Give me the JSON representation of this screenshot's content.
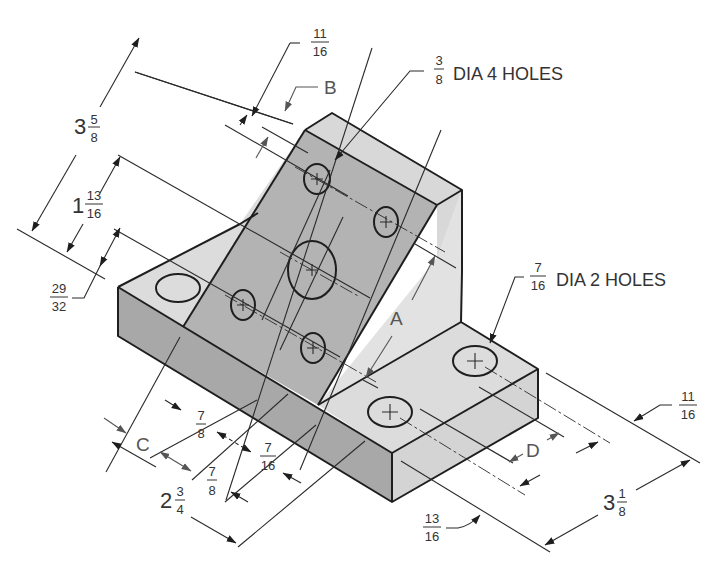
{
  "figure": {
    "type": "isometric dimensioned drawing"
  },
  "notes": {
    "holes_small": {
      "whole": "",
      "num": "3",
      "den": "8",
      "text": "DIA 4 HOLES"
    },
    "holes_base": {
      "whole": "",
      "num": "7",
      "den": "16",
      "text": "DIA 2 HOLES"
    }
  },
  "dimensions": {
    "overall_height_incline": {
      "whole": "3",
      "num": "5",
      "den": "8"
    },
    "top_offset": {
      "whole": "",
      "num": "11",
      "den": "16"
    },
    "hole_spacing_incline": {
      "whole": "1",
      "num": "13",
      "den": "16"
    },
    "lower_offset": {
      "whole": "",
      "num": "29",
      "den": "32"
    },
    "width_base_front": {
      "whole": "2",
      "num": "3",
      "den": "4"
    },
    "hole_spacing_a": {
      "whole": "",
      "num": "7",
      "den": "8"
    },
    "hole_spacing_b": {
      "whole": "",
      "num": "7",
      "den": "8"
    },
    "edge_offset_front": {
      "whole": "",
      "num": "7",
      "den": "16"
    },
    "base_depth": {
      "whole": "3",
      "num": "1",
      "den": "8"
    },
    "base_hole_offset_right": {
      "whole": "",
      "num": "11",
      "den": "16"
    },
    "base_hole_offset_front": {
      "whole": "",
      "num": "13",
      "den": "16"
    }
  },
  "unknowns": {
    "a": "A",
    "b": "B",
    "c": "C",
    "d": "D"
  },
  "colors": {
    "line": "#1e1e1e",
    "face_dark": "#a8a8a8",
    "face_mid": "#b3b3b3",
    "face_light": "#dcdcdc",
    "text": "#333333"
  }
}
